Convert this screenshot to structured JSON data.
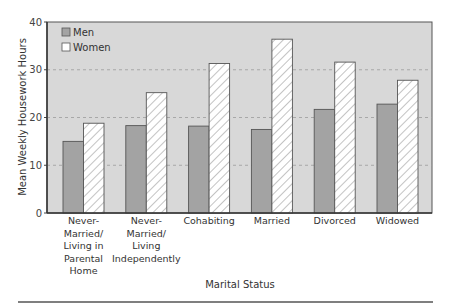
{
  "chart_data": {
    "type": "bar",
    "title": "",
    "xlabel": "Marital Status",
    "ylabel": "Mean Weekly Housework Hours",
    "ylim": [
      0,
      40
    ],
    "yticks": [
      0,
      10,
      20,
      30,
      40
    ],
    "grid": "horizontal dashed",
    "legend_position": "top-left inside",
    "categories": [
      [
        "Never-",
        "Married/",
        "Living in",
        "Parental",
        "Home"
      ],
      [
        "Never-",
        "Married/",
        "Living",
        "Independently"
      ],
      [
        "Cohabiting"
      ],
      [
        "Married"
      ],
      [
        "Divorced"
      ],
      [
        "Widowed"
      ]
    ],
    "category_names": [
      "Never-Married/Living in Parental Home",
      "Never-Married/Living Independently",
      "Cohabiting",
      "Married",
      "Divorced",
      "Widowed"
    ],
    "series": [
      {
        "name": "Men",
        "style": "solid gray",
        "values": [
          15,
          18.3,
          18.2,
          17.5,
          21.7,
          22.8
        ]
      },
      {
        "name": "Women",
        "style": "white hatched",
        "values": [
          18.8,
          25.2,
          31.3,
          36.4,
          31.6,
          27.8
        ]
      }
    ]
  },
  "colors": {
    "plot_bg": "#d8d8d8",
    "men_bar": "#a3a3a3",
    "women_bar": "#ffffff",
    "hatch": "#9a9a9a",
    "grid": "#9c9c9c",
    "axis": "#444444"
  }
}
